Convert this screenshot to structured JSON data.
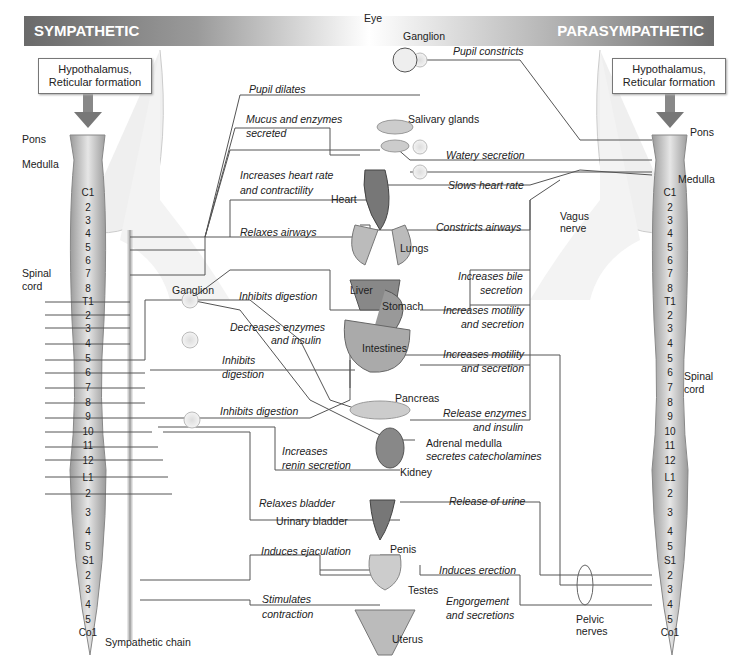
{
  "header": {
    "left_title": "SYMPATHETIC",
    "right_title": "PARASYMPATHETIC"
  },
  "brain_box_left": {
    "line1": "Hypothalamus,",
    "line2": "Reticular formation"
  },
  "brain_box_right": {
    "line1": "Hypothalamus,",
    "line2": "Reticular formation"
  },
  "left_labels": {
    "pons": "Pons",
    "medulla": "Medulla",
    "spinal": "Spinal",
    "cord": "cord",
    "chain": "Sympathetic chain",
    "ganglion": "Ganglion"
  },
  "right_labels": {
    "pons": "Pons",
    "medulla": "Medulla",
    "spinal": "Spinal",
    "cord": "cord",
    "vagus1": "Vagus",
    "vagus2": "nerve",
    "pelvic1": "Pelvic",
    "pelvic2": "nerves"
  },
  "segments": [
    "C1",
    "2",
    "3",
    "4",
    "5",
    "6",
    "7",
    "8",
    "T1",
    "2",
    "3",
    "4",
    "5",
    "6",
    "7",
    "8",
    "9",
    "10",
    "11",
    "12",
    "L1",
    "2",
    "3",
    "4",
    "5",
    "S1",
    "2",
    "3",
    "4",
    "5",
    "Co1"
  ],
  "organs": {
    "eye": "Eye",
    "ganglion_top": "Ganglion",
    "salivary": "Salivary glands",
    "heart": "Heart",
    "lungs": "Lungs",
    "liver": "Liver",
    "stomach": "Stomach",
    "intestines": "Intestines",
    "pancreas": "Pancreas",
    "adrenal1": "Adrenal medulla",
    "adrenal2": "secretes catecholamines",
    "kidney": "Kidney",
    "bladder": "Urinary bladder",
    "penis": "Penis",
    "testes": "Testes",
    "uterus": "Uterus"
  },
  "sympathetic_effects": {
    "pupil": "Pupil dilates",
    "mucus1": "Mucus and enzymes",
    "mucus2": "secreted",
    "heart1": "Increases heart rate",
    "heart2": "and contractility",
    "airways": "Relaxes airways",
    "digest1": "Inhibits digestion",
    "enzymes1": "Decreases enzymes",
    "enzymes2": "and insulin",
    "digest2a": "Inhibits",
    "digest2b": "digestion",
    "digest3": "Inhibits digestion",
    "renin1": "Increases",
    "renin2": "renin secretion",
    "bladder": "Relaxes bladder",
    "ejac": "Induces ejaculation",
    "contract1": "Stimulates",
    "contract2": "contraction"
  },
  "parasympathetic_effects": {
    "pupil": "Pupil constricts",
    "watery": "Watery secretion",
    "heart": "Slows heart rate",
    "airways": "Constricts airways",
    "bile1": "Increases bile",
    "bile2": "secretion",
    "motility1a": "Increases motility",
    "motility1b": "and secretion",
    "motility2a": "Increases motility",
    "motility2b": "and secretion",
    "enzymes1": "Release enzymes",
    "enzymes2": "and insulin",
    "urine": "Release of urine",
    "erection": "Induces erection",
    "engorge1": "Engorgement",
    "engorge2": "and secretions"
  }
}
